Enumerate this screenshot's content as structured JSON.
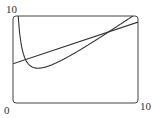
{
  "chart_data": {
    "type": "line",
    "title": "",
    "xlabel": "",
    "ylabel": "",
    "xlim": [
      0,
      10
    ],
    "ylim": [
      0,
      10
    ],
    "tick_labels": {
      "x_min": "0",
      "x_max": "10",
      "y_max": "10"
    },
    "grid": false,
    "legend": null,
    "series": [
      {
        "name": "curve",
        "x": [
          0.4,
          0.5,
          0.75,
          1,
          1.5,
          2,
          3,
          4,
          5,
          6,
          7,
          8,
          9,
          10
        ],
        "y": [
          10.4,
          8.5,
          6.08,
          5.0,
          4.17,
          4.0,
          4.33,
          5.0,
          5.8,
          6.67,
          7.57,
          8.5,
          9.44,
          10.4
        ]
      },
      {
        "name": "line",
        "x": [
          0,
          10
        ],
        "y": [
          4.5,
          9.3
        ]
      }
    ]
  },
  "labels": {
    "origin": "0",
    "x_max": "10",
    "y_max": "10"
  }
}
